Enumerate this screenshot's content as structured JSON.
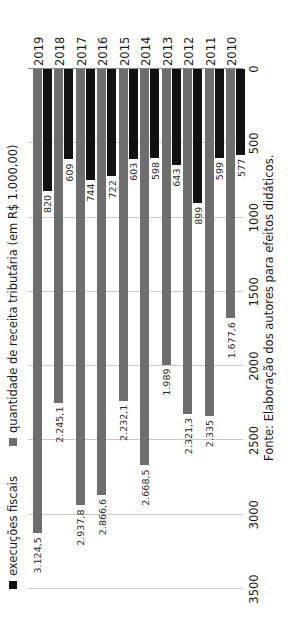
{
  "chart_data": {
    "type": "bar",
    "orientation": "horizontal",
    "title": "",
    "xlabel": "",
    "ylabel": "",
    "categories": [
      "2010",
      "2011",
      "2012",
      "2013",
      "2014",
      "2015",
      "2016",
      "2017",
      "2018",
      "2019"
    ],
    "series": [
      {
        "name": "execuções fiscais",
        "color": "#111111",
        "values": [
          577,
          599,
          899,
          643,
          598,
          603,
          722,
          744,
          609,
          820
        ],
        "labels": [
          "577",
          "599",
          "899",
          "643",
          "598",
          "603",
          "722",
          "744",
          "609",
          "820"
        ]
      },
      {
        "name": "quantidade de receita tributária (em R$ 1.000,00)",
        "color": "#6e6e6e",
        "values": [
          1677.6,
          2335,
          2321.3,
          1989,
          2668.5,
          2232.1,
          2866.6,
          2937.8,
          2245.1,
          3124.5
        ],
        "labels": [
          "1.677,6",
          "2.335",
          "2.321,3",
          "1.989",
          "2.668,5",
          "2.232,1",
          "2.866,6",
          "2.937,8",
          "2.245,1",
          "3.124,5"
        ]
      }
    ],
    "axis_ticks": [
      "0",
      "500",
      "1000",
      "1500",
      "2000",
      "2500",
      "3000",
      "3500"
    ],
    "axis_tick_values": [
      0,
      500,
      1000,
      1500,
      2000,
      2500,
      3000,
      3500
    ],
    "xlim": [
      0,
      3500
    ],
    "grid": true,
    "legend_position": "top-left",
    "note": "Fonte: Elaboração dos autores para efeitos didáticos."
  },
  "legend": {
    "items": [
      {
        "label": "execuções fiscais",
        "swatch": "dark"
      },
      {
        "label": "quantidade de receita tributária (em R$ 1.000,00)",
        "swatch": "gray"
      }
    ]
  },
  "source": {
    "text": "Fonte: Elaboração dos autores para efeitos didáticos."
  }
}
